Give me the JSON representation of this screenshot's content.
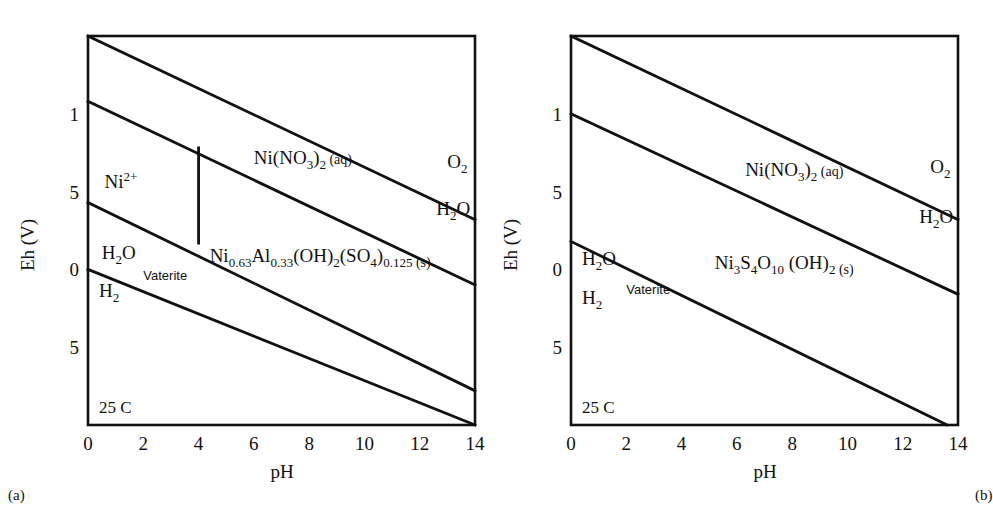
{
  "figure": {
    "background_color": "#ffffff",
    "line_color": "#111111",
    "shade_color": "#dedede",
    "captions": {
      "panel_a": "(a)",
      "panel_b": "(b)"
    }
  },
  "chart_data": [
    {
      "type": "line",
      "panel": "a",
      "title": "",
      "xlabel": "pH",
      "ylabel": "Eh (V)",
      "xlim": [
        0,
        14
      ],
      "ylim": [
        -1.0,
        1.5
      ],
      "grid": false,
      "legend": "none",
      "xticks": [
        0,
        2,
        4,
        6,
        8,
        10,
        12,
        14
      ],
      "xtick_labels": [
        "0",
        "2",
        "4",
        "6",
        "8",
        "10",
        "12",
        "14"
      ],
      "yticks": [
        1.0,
        0.5,
        0.0,
        -0.5
      ],
      "ytick_labels": [
        "1",
        "5",
        "0",
        "5"
      ],
      "ytick_labels_intended": [
        "1",
        "0.5",
        "0",
        "-0.5"
      ],
      "annotations": [
        {
          "text": "25 C",
          "x": 0.4,
          "y": -0.92
        },
        {
          "text": "Vaterite",
          "x": 2.0,
          "y": -0.07
        }
      ],
      "series": [
        {
          "name": "O2/H2O upper stability line",
          "points": [
            [
              0,
              1.5
            ],
            [
              14,
              0.32
            ]
          ]
        },
        {
          "name": "Ni(NO3)2 aq upper boundary",
          "points": [
            [
              0,
              1.08
            ],
            [
              14,
              -0.1
            ]
          ]
        },
        {
          "name": "solid phase upper boundary",
          "points": [
            [
              0,
              0.43
            ],
            [
              14,
              -0.78
            ]
          ]
        },
        {
          "name": "H2O/H2 lower stability line",
          "points": [
            [
              0,
              0.0
            ],
            [
              14,
              -1.0
            ]
          ]
        }
      ],
      "vertical_boundaries": [
        {
          "name": "Ni2+ / solid boundary",
          "x": 4.0,
          "y_from": 0.79,
          "y_to": 0.16
        }
      ],
      "shaded_regions": [
        {
          "name": "solid stability field",
          "vertices": [
            [
              4.0,
              0.79
            ],
            [
              14,
              0.0
            ],
            [
              14,
              -0.92
            ],
            [
              4.0,
              0.16
            ],
            [
              0.0,
              0.43
            ],
            [
              0.0,
              0.0
            ]
          ]
        }
      ],
      "region_labels": [
        {
          "name": "nickel-nitrate-aqueous",
          "text": "Ni(NO3)2 (aq)",
          "x": 6.0,
          "y": 0.68
        },
        {
          "name": "oxygen",
          "text": "O2",
          "x": 13.0,
          "y": 0.65
        },
        {
          "name": "nickel-ion",
          "text": "Ni2+",
          "x": 0.6,
          "y": 0.52
        },
        {
          "name": "water-upper",
          "text": "H2O",
          "x": 12.6,
          "y": 0.35
        },
        {
          "name": "water-lower",
          "text": "H2O",
          "x": 0.5,
          "y": 0.07
        },
        {
          "name": "hydrogen",
          "text": "H2",
          "x": 0.4,
          "y": -0.18
        },
        {
          "name": "solid-phase",
          "text": "Ni0.63Al0.33(OH)2(SO4)0.125 (s)",
          "x": 4.4,
          "y": 0.05
        }
      ]
    },
    {
      "type": "line",
      "panel": "b",
      "title": "",
      "xlabel": "pH",
      "ylabel": "Eh (V)",
      "xlim": [
        0,
        14
      ],
      "ylim": [
        -1.0,
        1.5
      ],
      "grid": false,
      "legend": "none",
      "xticks": [
        0,
        2,
        4,
        6,
        8,
        10,
        12,
        14
      ],
      "xtick_labels": [
        "0",
        "2",
        "4",
        "6",
        "8",
        "10",
        "12",
        "14"
      ],
      "yticks": [
        1.0,
        0.5,
        0.0,
        -0.5
      ],
      "ytick_labels": [
        "1",
        "5",
        "0",
        "5"
      ],
      "ytick_labels_intended": [
        "1",
        "0.5",
        "0",
        "-0.5"
      ],
      "annotations": [
        {
          "text": "25 C",
          "x": 0.4,
          "y": -0.92
        },
        {
          "text": "Vaterite",
          "x": 2.0,
          "y": -0.16
        }
      ],
      "series": [
        {
          "name": "O2/H2O upper stability line",
          "points": [
            [
              0,
              1.5
            ],
            [
              14,
              0.32
            ]
          ]
        },
        {
          "name": "solid phase upper boundary",
          "points": [
            [
              0,
              1.0
            ],
            [
              14,
              -0.16
            ]
          ]
        },
        {
          "name": "H2O/H2 lower stability line",
          "points": [
            [
              0,
              0.18
            ],
            [
              13.6,
              -1.0
            ]
          ]
        }
      ],
      "vertical_boundaries": [],
      "shaded_regions": [
        {
          "name": "solid stability field",
          "vertices": [
            [
              0.0,
              1.0
            ],
            [
              14,
              -0.16
            ],
            [
              14,
              -1.0
            ],
            [
              13.6,
              -1.0
            ],
            [
              0.0,
              0.18
            ]
          ]
        }
      ],
      "region_labels": [
        {
          "name": "nickel-nitrate-aqueous",
          "text": "Ni(NO3)2 (aq)",
          "x": 6.3,
          "y": 0.6
        },
        {
          "name": "oxygen",
          "text": "O2",
          "x": 13.0,
          "y": 0.62
        },
        {
          "name": "water-upper",
          "text": "H2O",
          "x": 12.6,
          "y": 0.3
        },
        {
          "name": "water-lower",
          "text": "H2O",
          "x": 0.4,
          "y": 0.03
        },
        {
          "name": "hydrogen",
          "text": "H2",
          "x": 0.4,
          "y": -0.22
        },
        {
          "name": "solid-phase",
          "text": "Ni3S4O10(OH)2 (s)",
          "x": 5.2,
          "y": 0.0
        }
      ]
    }
  ]
}
